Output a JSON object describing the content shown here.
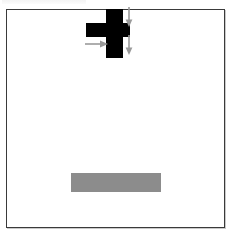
{
  "figure": {
    "background_color": "#ffffff",
    "frame_color": "#3a3a3a",
    "shapes": {
      "cross": {
        "name": "black-cross",
        "color": "#000000",
        "horizontal_arm": {
          "x": 79,
          "y": 13,
          "width": 44,
          "height": 14
        },
        "vertical_arm": {
          "x": 99,
          "y": -1,
          "width": 17,
          "height": 49
        }
      },
      "bar": {
        "name": "gray-bar",
        "color": "#8c8c8c",
        "x": 64,
        "y": 163,
        "width": 90,
        "height": 19
      }
    },
    "arrows": [
      {
        "name": "arrow-down-top",
        "direction": "down",
        "color": "#9a9a9a",
        "x": 117,
        "y": -3,
        "length": 19
      },
      {
        "name": "arrow-down-bottom",
        "direction": "down",
        "color": "#9a9a9a",
        "x": 117,
        "y": 25,
        "length": 19
      },
      {
        "name": "arrow-right",
        "direction": "right",
        "color": "#9a9a9a",
        "x": 78,
        "y": 29,
        "length": 22
      }
    ]
  }
}
